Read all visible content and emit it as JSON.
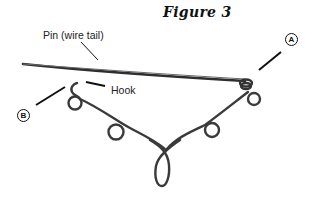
{
  "figure": {
    "title": "Figure 3",
    "labels": {
      "pin": "Pin (wire tail)",
      "hook": "Hook"
    },
    "callouts": {
      "a": "A",
      "b": "B"
    },
    "colors": {
      "wire": "#3a3a3a",
      "leader": "#111111",
      "background": "#ffffff"
    }
  }
}
